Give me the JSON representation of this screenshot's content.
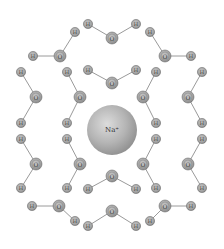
{
  "diagram": {
    "ion": {
      "label": "Na⁺",
      "x": 112,
      "y": 130,
      "r": 25
    },
    "colors": {
      "background": "#ffffff",
      "bond": "#9a9a9a",
      "atom_fill": "#a8a8a8",
      "atom_ring": "#707070",
      "ion_light": "#d6d6d6",
      "ion_dark": "#8a8a8a"
    },
    "atoms": [
      {
        "id": "o1",
        "el": "O",
        "x": 60,
        "y": 56
      },
      {
        "id": "h1a",
        "el": "H",
        "x": 33,
        "y": 56
      },
      {
        "id": "h1b",
        "el": "H",
        "x": 75,
        "y": 32
      },
      {
        "id": "o2",
        "el": "O",
        "x": 112,
        "y": 38
      },
      {
        "id": "h2a",
        "el": "H",
        "x": 88,
        "y": 24
      },
      {
        "id": "h2b",
        "el": "H",
        "x": 136,
        "y": 24
      },
      {
        "id": "o3",
        "el": "O",
        "x": 165,
        "y": 56
      },
      {
        "id": "h3a",
        "el": "H",
        "x": 150,
        "y": 32
      },
      {
        "id": "h3b",
        "el": "H",
        "x": 191,
        "y": 56
      },
      {
        "id": "o4",
        "el": "O",
        "x": 112,
        "y": 83
      },
      {
        "id": "h4a",
        "el": "H",
        "x": 88,
        "y": 70
      },
      {
        "id": "h4b",
        "el": "H",
        "x": 136,
        "y": 70
      },
      {
        "id": "o5",
        "el": "O",
        "x": 36,
        "y": 97
      },
      {
        "id": "h5a",
        "el": "H",
        "x": 21,
        "y": 72
      },
      {
        "id": "h5b",
        "el": "H",
        "x": 21,
        "y": 123
      },
      {
        "id": "o6",
        "el": "O",
        "x": 80,
        "y": 97
      },
      {
        "id": "h6a",
        "el": "H",
        "x": 67,
        "y": 72
      },
      {
        "id": "h6b",
        "el": "H",
        "x": 67,
        "y": 123
      },
      {
        "id": "o7",
        "el": "O",
        "x": 143,
        "y": 97
      },
      {
        "id": "h7a",
        "el": "H",
        "x": 156,
        "y": 72
      },
      {
        "id": "h7b",
        "el": "H",
        "x": 156,
        "y": 123
      },
      {
        "id": "o8",
        "el": "O",
        "x": 188,
        "y": 97
      },
      {
        "id": "h8a",
        "el": "H",
        "x": 202,
        "y": 72
      },
      {
        "id": "h8b",
        "el": "H",
        "x": 202,
        "y": 123
      },
      {
        "id": "o9",
        "el": "O",
        "x": 36,
        "y": 164
      },
      {
        "id": "h9a",
        "el": "H",
        "x": 21,
        "y": 139
      },
      {
        "id": "h9b",
        "el": "H",
        "x": 21,
        "y": 188
      },
      {
        "id": "o10",
        "el": "O",
        "x": 80,
        "y": 164
      },
      {
        "id": "h10a",
        "el": "H",
        "x": 67,
        "y": 139
      },
      {
        "id": "h10b",
        "el": "H",
        "x": 67,
        "y": 188
      },
      {
        "id": "o11",
        "el": "O",
        "x": 143,
        "y": 164
      },
      {
        "id": "h11a",
        "el": "H",
        "x": 156,
        "y": 139
      },
      {
        "id": "h11b",
        "el": "H",
        "x": 156,
        "y": 188
      },
      {
        "id": "o12",
        "el": "O",
        "x": 188,
        "y": 164
      },
      {
        "id": "h12a",
        "el": "H",
        "x": 202,
        "y": 139
      },
      {
        "id": "h12b",
        "el": "H",
        "x": 202,
        "y": 188
      },
      {
        "id": "o13",
        "el": "O",
        "x": 112,
        "y": 176
      },
      {
        "id": "h13a",
        "el": "H",
        "x": 88,
        "y": 189
      },
      {
        "id": "h13b",
        "el": "H",
        "x": 136,
        "y": 189
      },
      {
        "id": "o14",
        "el": "O",
        "x": 59,
        "y": 206
      },
      {
        "id": "h14a",
        "el": "H",
        "x": 32,
        "y": 206
      },
      {
        "id": "h14b",
        "el": "H",
        "x": 75,
        "y": 221
      },
      {
        "id": "o15",
        "el": "O",
        "x": 112,
        "y": 211
      },
      {
        "id": "h15a",
        "el": "H",
        "x": 88,
        "y": 226
      },
      {
        "id": "h15b",
        "el": "H",
        "x": 136,
        "y": 226
      },
      {
        "id": "o16",
        "el": "O",
        "x": 165,
        "y": 206
      },
      {
        "id": "h16a",
        "el": "H",
        "x": 191,
        "y": 206
      },
      {
        "id": "h16b",
        "el": "H",
        "x": 150,
        "y": 221
      }
    ],
    "bonds": [
      [
        "o1",
        "h1a"
      ],
      [
        "o1",
        "h1b"
      ],
      [
        "o2",
        "h2a"
      ],
      [
        "o2",
        "h2b"
      ],
      [
        "o3",
        "h3a"
      ],
      [
        "o3",
        "h3b"
      ],
      [
        "o4",
        "h4a"
      ],
      [
        "o4",
        "h4b"
      ],
      [
        "o5",
        "h5a"
      ],
      [
        "o5",
        "h5b"
      ],
      [
        "o6",
        "h6a"
      ],
      [
        "o6",
        "h6b"
      ],
      [
        "o7",
        "h7a"
      ],
      [
        "o7",
        "h7b"
      ],
      [
        "o8",
        "h8a"
      ],
      [
        "o8",
        "h8b"
      ],
      [
        "o9",
        "h9a"
      ],
      [
        "o9",
        "h9b"
      ],
      [
        "o10",
        "h10a"
      ],
      [
        "o10",
        "h10b"
      ],
      [
        "o11",
        "h11a"
      ],
      [
        "o11",
        "h11b"
      ],
      [
        "o12",
        "h12a"
      ],
      [
        "o12",
        "h12b"
      ],
      [
        "o13",
        "h13a"
      ],
      [
        "o13",
        "h13b"
      ],
      [
        "o14",
        "h14a"
      ],
      [
        "o14",
        "h14b"
      ],
      [
        "o15",
        "h15a"
      ],
      [
        "o15",
        "h15b"
      ],
      [
        "o16",
        "h16a"
      ],
      [
        "o16",
        "h16b"
      ]
    ],
    "atom_sizes": {
      "O": 6,
      "H": 4.6
    },
    "atom_font_sizes": {
      "O": 6,
      "H": 5
    }
  }
}
